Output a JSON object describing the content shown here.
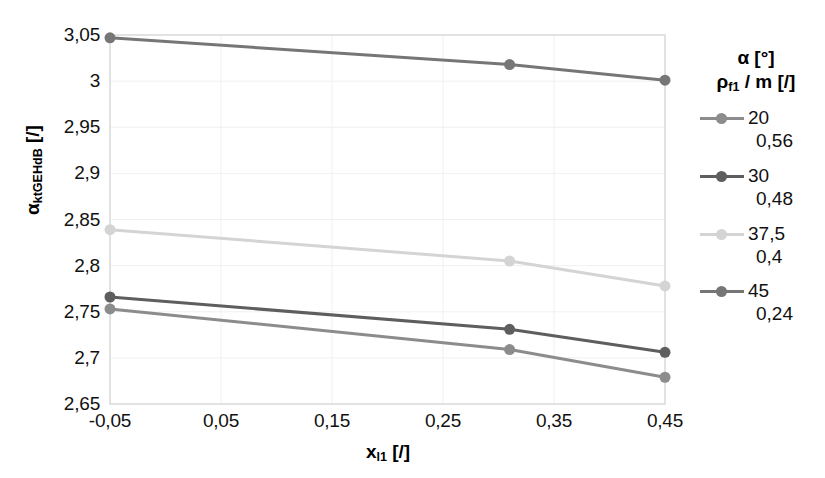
{
  "chart_data": {
    "type": "line",
    "title": "",
    "xlabel": "x_l1 [/]",
    "ylabel": "alpha_ktGEHdB [/]",
    "xlim": [
      -0.05,
      0.45
    ],
    "ylim": [
      2.65,
      3.05
    ],
    "grid": true,
    "legend_position": "right",
    "x": [
      -0.05,
      0.31,
      0.45
    ],
    "xticks": [
      "-0,05",
      "0,05",
      "0,15",
      "0,25",
      "0,35",
      "0,45"
    ],
    "yticks": [
      "2,65",
      "2,7",
      "2,75",
      "2,8",
      "2,85",
      "2,9",
      "2,95",
      "3",
      "3,05"
    ],
    "series": [
      {
        "name": "20",
        "sub": "0,56",
        "color": "#8c8c8c",
        "values": [
          2.753,
          2.709,
          2.679
        ]
      },
      {
        "name": "30",
        "sub": "0,48",
        "color": "#5e5e5e",
        "values": [
          2.766,
          2.731,
          2.706
        ]
      },
      {
        "name": "37,5",
        "sub": "0,4",
        "color": "#d4d4d4",
        "values": [
          2.839,
          2.805,
          2.778
        ]
      },
      {
        "name": "45",
        "sub": "0,24",
        "color": "#767676",
        "values": [
          3.047,
          3.018,
          3.001
        ]
      }
    ]
  },
  "axes": {
    "y_title_main": "α",
    "y_title_sub": "ktGEHdB",
    "y_title_unit": " [/]",
    "x_title_main": "x",
    "x_title_sub": "l1",
    "x_title_unit": " [/]"
  },
  "legend": {
    "header_line1": "α [°]",
    "header_line2_main": "ρ",
    "header_line2_sub": "f1",
    "header_line2_rest": " / m [/]",
    "entries": [
      {
        "label": "20",
        "sublabel": "0,56",
        "color": "#8c8c8c"
      },
      {
        "label": "30",
        "sublabel": "0,48",
        "color": "#5e5e5e"
      },
      {
        "label": "37,5",
        "sublabel": "0,4",
        "color": "#d4d4d4"
      },
      {
        "label": "45",
        "sublabel": "0,24",
        "color": "#767676"
      }
    ]
  },
  "style": {
    "plot_border": "#d9d9d9",
    "grid_color": "#f0f0f0",
    "background": "#ffffff"
  }
}
